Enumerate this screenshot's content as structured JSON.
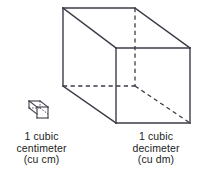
{
  "figure": {
    "background_color": "#ffffff",
    "line_color": "#3b3b47",
    "text_color": "#1c1c1c",
    "small_cube": {
      "name": "cubic-centimeter-cube",
      "label_lines": [
        "1 cubic",
        "centimeter",
        "(cu cm)"
      ],
      "unit": "cu cm",
      "quantity": "1 cubic centimeter"
    },
    "large_cube": {
      "name": "cubic-decimeter-cube",
      "label_lines": [
        "1 cubic",
        "decimeter",
        "(cu dm)"
      ],
      "unit": "cu dm",
      "quantity": "1 cubic decimeter"
    }
  },
  "labels": {
    "cm": {
      "line1": "1 cubic",
      "line2": "centimeter",
      "line3": "(cu cm)"
    },
    "dm": {
      "line1": "1 cubic",
      "line2": "decimeter",
      "line3": "(cu dm)"
    }
  }
}
